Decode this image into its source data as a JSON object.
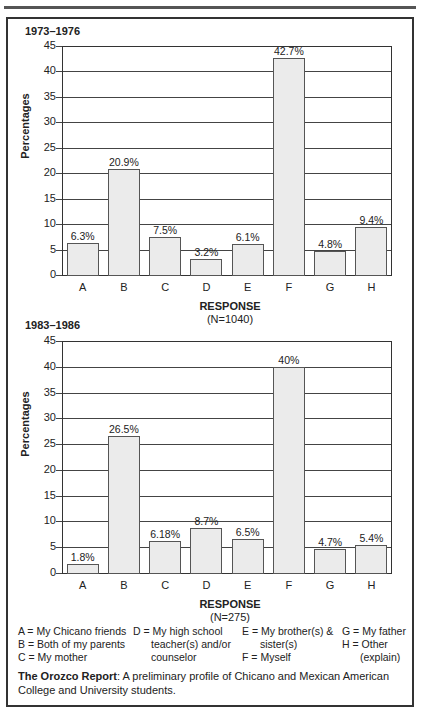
{
  "page": {
    "header_fragment": "...aging by the family or the teaching of English..."
  },
  "chart_data": [
    {
      "type": "bar",
      "title": "1973–1976",
      "categories": [
        "A",
        "B",
        "C",
        "D",
        "E",
        "F",
        "G",
        "H"
      ],
      "values": [
        6.3,
        20.9,
        7.5,
        3.2,
        6.1,
        42.7,
        4.8,
        9.4
      ],
      "value_labels": [
        "6.3%",
        "20.9%",
        "7.5%",
        "3.2%",
        "6.1%",
        "42.7%",
        "4.8%",
        "9.4%"
      ],
      "xlabel": "RESPONSE",
      "xlabel_sub": "(N=1040)",
      "ylabel": "Percentages",
      "ylim": [
        0,
        45
      ],
      "yticks": [
        "0",
        "5",
        "10",
        "15",
        "20",
        "25",
        "30",
        "35",
        "40",
        "45"
      ],
      "grid": true,
      "legend_position": "none"
    },
    {
      "type": "bar",
      "title": "1983–1986",
      "categories": [
        "A",
        "B",
        "C",
        "D",
        "E",
        "F",
        "G",
        "H"
      ],
      "values": [
        1.8,
        26.5,
        6.18,
        8.7,
        6.5,
        40,
        4.7,
        5.4
      ],
      "value_labels": [
        "1.8%",
        "26.5%",
        "6.18%",
        "8.7%",
        "6.5%",
        "40%",
        "4.7%",
        "5.4%"
      ],
      "xlabel": "RESPONSE",
      "xlabel_sub": "(N=275)",
      "ylabel": "Percentages",
      "ylim": [
        0,
        45
      ],
      "yticks": [
        "0",
        "5",
        "10",
        "15",
        "20",
        "25",
        "30",
        "35",
        "40",
        "45"
      ],
      "grid": true,
      "legend_position": "none"
    }
  ],
  "legend": {
    "col1": [
      "A = My Chicano friends",
      "B = Both of my parents",
      "C = My mother"
    ],
    "col2": [
      "D = My high school",
      "teacher(s) and/or",
      "counselor"
    ],
    "col3": [
      "E = My brother(s) &",
      "sister(s)",
      "F = Myself"
    ],
    "col4": [
      "G = My father",
      "H = Other",
      "(explain)"
    ]
  },
  "caption": {
    "bold": "The Orozco Report",
    "text": ": A preliminary profile of Chicano and Mexican American College and University students."
  }
}
